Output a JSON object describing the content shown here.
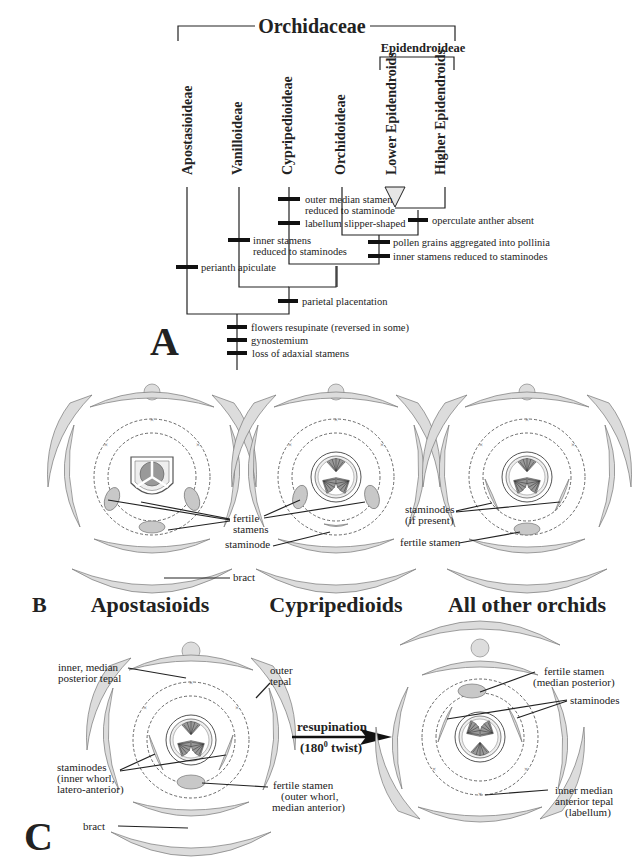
{
  "panel_a": {
    "label": "A",
    "family": "Orchidaceae",
    "subfamily_group": "Epidendroideae",
    "taxa": [
      {
        "name": "Apostasioideae"
      },
      {
        "name": "Vanilloideae"
      },
      {
        "name": "Cypripedioideae"
      },
      {
        "name": "Orchidoideae"
      },
      {
        "name": "Lower Epidendroids"
      },
      {
        "name": "Higher Epidendroids"
      }
    ],
    "characters": {
      "outer_median": "outer median stamen",
      "outer_median_2": "reduced to staminode",
      "labellum": "labellum slipper-shaped",
      "operculate": "operculate anther absent",
      "inner_vanilla_1": "inner stamens",
      "inner_vanilla_2": "reduced to staminodes",
      "pollinia": "pollen grains aggregated into pollinia",
      "inner_epi": "inner stamens reduced to staminodes",
      "perianth": "perianth apiculate",
      "parietal": "parietal placentation",
      "resupinate": "flowers resupinate (reversed in some)",
      "gynostemium": "gynostemium",
      "adaxial": "loss of adaxial stamens"
    }
  },
  "panel_b": {
    "label": "B",
    "diagrams": [
      {
        "title": "Apostasioids",
        "labels": {
          "fertile_1": "fertile",
          "fertile_2": "stamens",
          "staminode": "staminode",
          "bract": "bract"
        }
      },
      {
        "title": "Cypripedioids"
      },
      {
        "title": "All other orchids",
        "labels": {
          "staminodes_1": "staminodes",
          "staminodes_2": "(if present)",
          "fertile": "fertile stamen"
        }
      }
    ]
  },
  "panel_c": {
    "label": "C",
    "left": {
      "inner_tepal_1": "inner, median",
      "inner_tepal_2": "posterior tepal",
      "outer_tepal_1": "outer",
      "outer_tepal_2": "tepal",
      "staminodes_1": "staminodes",
      "staminodes_2": "(inner whorl,",
      "staminodes_3": "latero-anterior)",
      "fertile_1": "fertile stamen",
      "fertile_2": "(outer whorl,",
      "fertile_3": "median anterior)",
      "bract": "bract"
    },
    "arrow": {
      "label_1": "resupination",
      "label_2_pre": "(180",
      "label_2_sup": "0",
      "label_2_post": " twist)"
    },
    "right": {
      "fertile_1": "fertile stamen",
      "fertile_2": "(median posterior)",
      "staminodes": "staminodes",
      "labellum_1": "inner median",
      "labellum_2": "anterior tepal",
      "labellum_3": "(labellum)"
    }
  }
}
